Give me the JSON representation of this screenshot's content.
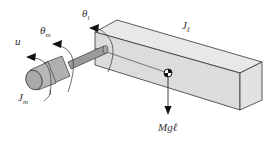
{
  "diagram": {
    "title": "",
    "labels": {
      "input_torque": "u",
      "motor_angle": "θ",
      "motor_angle_sub": "m",
      "link_angle": "θ",
      "link_angle_sub": "l",
      "motor_inertia": "J",
      "motor_inertia_sub": "m",
      "link_inertia": "J",
      "link_inertia_sub": "ℓ",
      "gravity_force": "Mgℓ"
    },
    "components": [
      "motor-cylinder",
      "shaft",
      "link-box",
      "center-of-mass",
      "gravity-arrow",
      "rotation-arrows"
    ],
    "colors": {
      "body_fill": "#d9d9d9",
      "body_top": "#e6e6e6",
      "cylinder_fill": "#b8b8b8",
      "stroke": "#333333"
    }
  }
}
